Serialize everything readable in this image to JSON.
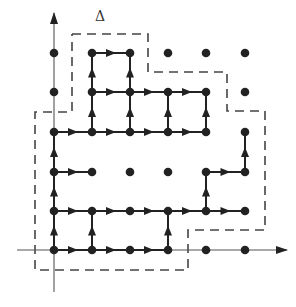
{
  "diagram": {
    "label": "Δ",
    "colors": {
      "ink": "#222222",
      "dash": "#444444",
      "axis": "#555555",
      "background": "#ffffff"
    },
    "grid": {
      "columns_x": [
        54,
        92,
        130,
        168,
        206,
        245
      ],
      "rows_y": [
        250,
        211,
        172,
        132,
        92,
        53
      ]
    },
    "axes": {
      "x": {
        "from": [
          17,
          250
        ],
        "to": [
          287,
          250
        ]
      },
      "y": {
        "from": [
          54,
          292
        ],
        "to": [
          54,
          13
        ]
      }
    },
    "points": [
      [
        0,
        0
      ],
      [
        1,
        0
      ],
      [
        2,
        0
      ],
      [
        3,
        0
      ],
      [
        4,
        0
      ],
      [
        5,
        0
      ],
      [
        0,
        1
      ],
      [
        1,
        1
      ],
      [
        2,
        1
      ],
      [
        3,
        1
      ],
      [
        4,
        1
      ],
      [
        5,
        1
      ],
      [
        0,
        2
      ],
      [
        1,
        2
      ],
      [
        2,
        2
      ],
      [
        3,
        2
      ],
      [
        4,
        2
      ],
      [
        5,
        2
      ],
      [
        0,
        3
      ],
      [
        1,
        3
      ],
      [
        2,
        3
      ],
      [
        3,
        3
      ],
      [
        4,
        3
      ],
      [
        5,
        3
      ],
      [
        0,
        4
      ],
      [
        1,
        4
      ],
      [
        2,
        4
      ],
      [
        3,
        4
      ],
      [
        4,
        4
      ],
      [
        5,
        4
      ],
      [
        0,
        5
      ],
      [
        1,
        5
      ],
      [
        2,
        5
      ],
      [
        3,
        5
      ],
      [
        4,
        5
      ],
      [
        5,
        5
      ]
    ],
    "edges": [
      [
        [
          0,
          0
        ],
        [
          1,
          0
        ]
      ],
      [
        [
          1,
          0
        ],
        [
          2,
          0
        ]
      ],
      [
        [
          2,
          0
        ],
        [
          3,
          0
        ]
      ],
      [
        [
          0,
          1
        ],
        [
          1,
          1
        ]
      ],
      [
        [
          1,
          1
        ],
        [
          2,
          1
        ]
      ],
      [
        [
          2,
          1
        ],
        [
          3,
          1
        ]
      ],
      [
        [
          3,
          1
        ],
        [
          4,
          1
        ]
      ],
      [
        [
          4,
          1
        ],
        [
          5,
          1
        ]
      ],
      [
        [
          0,
          2
        ],
        [
          1,
          2
        ]
      ],
      [
        [
          4,
          2
        ],
        [
          5,
          2
        ]
      ],
      [
        [
          0,
          3
        ],
        [
          1,
          3
        ]
      ],
      [
        [
          1,
          3
        ],
        [
          2,
          3
        ]
      ],
      [
        [
          2,
          3
        ],
        [
          3,
          3
        ]
      ],
      [
        [
          3,
          3
        ],
        [
          4,
          3
        ]
      ],
      [
        [
          1,
          4
        ],
        [
          2,
          4
        ]
      ],
      [
        [
          2,
          4
        ],
        [
          3,
          4
        ]
      ],
      [
        [
          3,
          4
        ],
        [
          4,
          4
        ]
      ],
      [
        [
          1,
          5
        ],
        [
          2,
          5
        ]
      ],
      [
        [
          0,
          0
        ],
        [
          0,
          1
        ]
      ],
      [
        [
          1,
          0
        ],
        [
          1,
          1
        ]
      ],
      [
        [
          3,
          0
        ],
        [
          3,
          1
        ]
      ],
      [
        [
          0,
          1
        ],
        [
          0,
          2
        ]
      ],
      [
        [
          4,
          1
        ],
        [
          4,
          2
        ]
      ],
      [
        [
          0,
          2
        ],
        [
          0,
          3
        ]
      ],
      [
        [
          5,
          2
        ],
        [
          5,
          3
        ]
      ],
      [
        [
          1,
          3
        ],
        [
          1,
          4
        ]
      ],
      [
        [
          2,
          3
        ],
        [
          2,
          4
        ]
      ],
      [
        [
          3,
          3
        ],
        [
          3,
          4
        ]
      ],
      [
        [
          4,
          3
        ],
        [
          4,
          4
        ]
      ],
      [
        [
          1,
          4
        ],
        [
          1,
          5
        ]
      ],
      [
        [
          2,
          4
        ],
        [
          2,
          5
        ]
      ]
    ],
    "dashed_boundary": [
      [
        72,
        34
      ],
      [
        148,
        34
      ],
      [
        148,
        72
      ],
      [
        227,
        72
      ],
      [
        227,
        111
      ],
      [
        265,
        111
      ],
      [
        265,
        230
      ],
      [
        188,
        230
      ],
      [
        188,
        270
      ],
      [
        40,
        270
      ],
      [
        35,
        270
      ],
      [
        35,
        112
      ],
      [
        72,
        112
      ],
      [
        72,
        34
      ]
    ]
  }
}
